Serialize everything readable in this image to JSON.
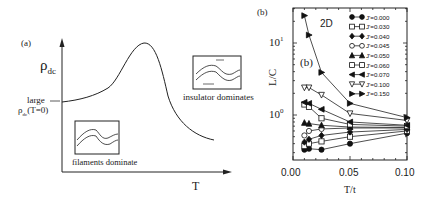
{
  "panel_a": {
    "label": "(a)",
    "y_axis_label": "ρ",
    "y_axis_sub": "dc",
    "x_axis_label": "T",
    "annotation_large": "large",
    "annotation_rho": "ρ",
    "annotation_rho_sub": "dc",
    "annotation_rho_arg": "(T=0)",
    "inset_right_caption": "insulator dominates",
    "inset_left_caption": "filaments dominate"
  },
  "panel_b": {
    "label_outer": "(b)",
    "label_inner": "(b)",
    "dimension_label": "2D"
  },
  "chart_data": [
    {
      "type": "line",
      "title": "(a) schematic",
      "xlabel": "T",
      "ylabel": "ρ_dc",
      "annotations": [
        "large ρ_dc(T=0)",
        "insulator dominates",
        "filaments dominate"
      ],
      "description": "Schematic: resistivity rises from a large T=0 value to a peak then falls at higher T",
      "x": [
        0.0,
        0.2,
        0.4,
        0.55,
        0.7,
        0.85,
        1.0
      ],
      "y": [
        0.45,
        0.5,
        0.62,
        0.95,
        0.75,
        0.35,
        0.22
      ]
    },
    {
      "type": "line",
      "title": "(b) 2D",
      "xlabel": "T/t",
      "ylabel": "L/C",
      "yscale": "log",
      "xlim": [
        0.0,
        0.1
      ],
      "ylim": [
        0.24,
        30
      ],
      "xticks": [
        "0.00",
        "0.05",
        "0.10"
      ],
      "yticks": [
        "10^0",
        "10^1"
      ],
      "legend_position": "upper right",
      "x": [
        0.01,
        0.014,
        0.025,
        0.05,
        0.1
      ],
      "series": [
        {
          "name": "J'=0.000",
          "marker": "filled-circle",
          "values": [
            0.33,
            0.34,
            0.33,
            0.4,
            0.56
          ]
        },
        {
          "name": "J'=0.030",
          "marker": "open-square",
          "values": [
            0.37,
            0.4,
            0.43,
            0.5,
            0.6
          ]
        },
        {
          "name": "J'=0.040",
          "marker": "filled-diamond",
          "values": [
            0.42,
            0.46,
            0.52,
            0.58,
            0.63
          ]
        },
        {
          "name": "J'=0.045",
          "marker": "open-circle",
          "values": [
            0.52,
            0.6,
            0.64,
            0.66,
            0.66
          ]
        },
        {
          "name": "J'=0.050",
          "marker": "filled-triangle-up",
          "values": [
            0.78,
            0.76,
            0.72,
            0.68,
            0.67
          ]
        },
        {
          "name": "J'=0.060",
          "marker": "open-square",
          "values": [
            1.4,
            1.3,
            0.9,
            0.74,
            0.7
          ]
        },
        {
          "name": "J'=0.070",
          "marker": "filled-triangle-left",
          "values": [
            1.5,
            1.45,
            1.2,
            0.8,
            0.72
          ]
        },
        {
          "name": "J'=0.100",
          "marker": "open-triangle-down",
          "values": [
            2.4,
            2.4,
            1.9,
            1.05,
            0.84
          ]
        },
        {
          "name": "J'=0.150",
          "marker": "filled-triangle-right",
          "values": [
            24.0,
            12.9,
            3.9,
            1.45,
            0.92
          ]
        }
      ]
    }
  ]
}
